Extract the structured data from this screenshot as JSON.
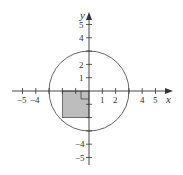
{
  "diagram": {
    "title": "",
    "axes": {
      "x_label": "x",
      "y_label": "y",
      "x_ticks": [
        -5,
        -4,
        -3,
        -2,
        -1,
        1,
        2,
        3,
        4,
        5
      ],
      "x_tick_labels": [
        "−5",
        "−4",
        "1",
        "2",
        "4",
        "5"
      ],
      "y_ticks": [
        -5,
        -4,
        -3,
        -2,
        -1,
        1,
        2,
        3,
        4,
        5
      ],
      "y_tick_labels": [
        "5",
        "4",
        "2",
        "1",
        "−4",
        "−5"
      ]
    },
    "circle": {
      "center": [
        0,
        0
      ],
      "radius": 3,
      "stroke": "#555555"
    },
    "shaded_square": {
      "x_range": [
        -2,
        0
      ],
      "y_range": [
        -2,
        0
      ],
      "fill": "#bdbdbd",
      "stroke": "#555555"
    },
    "right_angle_marker": {
      "at": [
        0,
        0
      ],
      "size": 0.6
    },
    "colors": {
      "axis": "#333333",
      "background": "#ffffff"
    }
  },
  "labels": {
    "x_axis": "x",
    "y_axis": "y",
    "xm5": "−5",
    "xm4": "−4",
    "x1": "1",
    "x2": "2",
    "x4": "4",
    "x5": "5",
    "y5": "5",
    "y4": "4",
    "y2": "2",
    "y1": "1",
    "ym4": "−4",
    "ym5": "−5"
  }
}
